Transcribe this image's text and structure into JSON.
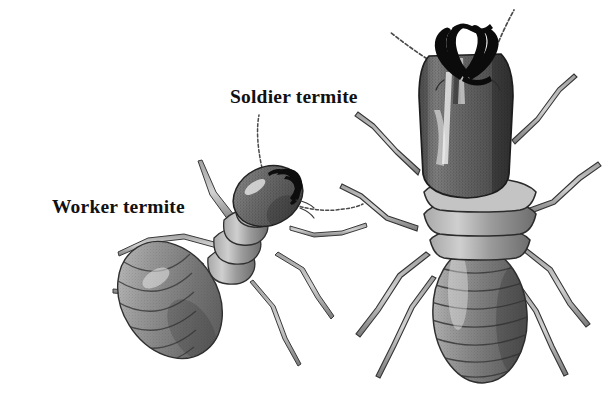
{
  "figure": {
    "kind": "scientific-illustration",
    "background_color": "#ffffff",
    "ink_color": "#111111",
    "body_gray": "#6f6f6f",
    "body_gray_dark": "#3f3f3f",
    "body_gray_light": "#b9b9b9",
    "mandible_color": "#0d0d0d",
    "style": "grayscale stippled pen-and-ink drawing"
  },
  "labels": {
    "worker": "Worker termite",
    "soldier": "Soldier termite"
  },
  "specimens": [
    {
      "name": "worker-termite",
      "label": "Worker termite",
      "relative_size": "smaller",
      "position": "left",
      "head": "small rounded oval head, tilted, pale highlight",
      "mandibles": "short dark curved mandibles",
      "antennae": 2,
      "legs": 6,
      "abdomen_segments": 9,
      "thorax_segments": 3
    },
    {
      "name": "soldier-termite",
      "label": "Soldier termite",
      "relative_size": "larger",
      "position": "right",
      "head": "large elongated rectangular head capsule, darkly shaded with highlight streak",
      "mandibles": "long black curved pincer mandibles",
      "antennae": 2,
      "legs": 6,
      "abdomen_segments": 8,
      "thorax_segments": 3
    }
  ]
}
